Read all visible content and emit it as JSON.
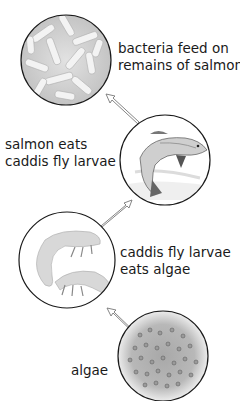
{
  "diagram": {
    "type": "food-chain",
    "stages": [
      {
        "id": "bacteria",
        "label_line1": "bacteria feed on",
        "label_line2": "remains of salmon",
        "image": "bacteria-icon"
      },
      {
        "id": "salmon",
        "label_line1": "salmon eats",
        "label_line2": "caddis fly larvae",
        "image": "salmon-icon"
      },
      {
        "id": "larvae",
        "label_line1": "caddis fly larvae",
        "label_line2": "eats algae",
        "image": "caddis-larvae-icon"
      },
      {
        "id": "algae",
        "label_line1": "algae",
        "label_line2": "",
        "image": "algae-icon"
      }
    ],
    "arrows": [
      {
        "from": "algae",
        "to": "larvae"
      },
      {
        "from": "larvae",
        "to": "salmon"
      },
      {
        "from": "salmon",
        "to": "bacteria"
      }
    ],
    "colors": {
      "outline": "#1a1a1a",
      "fill": "#e6e6e6",
      "arrow": "#888888",
      "text": "#1a1a1a"
    }
  }
}
